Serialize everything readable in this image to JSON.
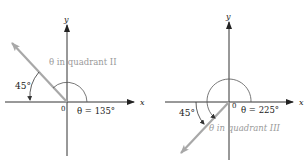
{
  "colors": {
    "axis": "#333333",
    "ray": "#a8a8a8",
    "arc": "#555555",
    "highlight_text": "#9a9a9a"
  },
  "diagrams": [
    {
      "axis_x_label": "x",
      "axis_y_label": "y",
      "origin_label": "0",
      "reference_angle_label": "45°",
      "angle_label": "θ = 135°",
      "quadrant_label": "θ in quadrant II",
      "angle_degrees": 135,
      "reference_angle_degrees": 45
    },
    {
      "axis_x_label": "x",
      "axis_y_label": "y",
      "origin_label": "0",
      "reference_angle_label": "45°",
      "angle_label": "θ = 225°",
      "quadrant_label": "θ in quadrant III",
      "angle_degrees": 225,
      "reference_angle_degrees": 45
    }
  ]
}
